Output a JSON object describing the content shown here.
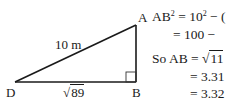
{
  "figure": {
    "vertices": {
      "A": "A",
      "B": "B",
      "D": "D"
    },
    "hypotenuse_label": "10 m",
    "base_label": "89",
    "base_label_prefix": "√",
    "right_angle_at": "B",
    "stroke_color": "#1a1a1a"
  },
  "working": {
    "line1": {
      "lhs": "AB",
      "lhs_sup": "2",
      "rel": " = 10",
      "rel_sup": "2",
      "rest": " − ("
    },
    "line2": {
      "text": "= 100 −"
    },
    "line3": {
      "prefix": "So AB = ",
      "sqrt_sym": "√",
      "radicand": "11"
    },
    "line4": {
      "text": "= 3.31"
    },
    "line5": {
      "text": "= 3.32"
    }
  }
}
